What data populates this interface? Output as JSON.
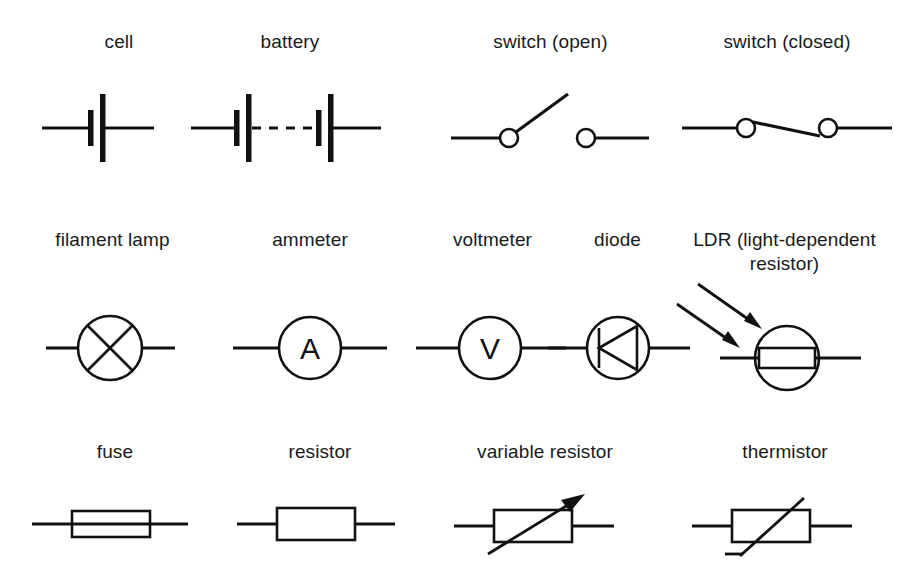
{
  "page": {
    "background_color": "#ffffff",
    "line_color": "#111111",
    "text_color": "#1a1a1a",
    "width": 914,
    "height": 562,
    "row_count": 3,
    "symbol_count": 13
  },
  "rows": [
    {
      "index": 1,
      "symbols": [
        {
          "label": "cell",
          "icon": "cell-symbol"
        },
        {
          "label": "battery",
          "icon": "battery-symbol"
        },
        {
          "label": "switch (open)",
          "icon": "switch-open-symbol"
        },
        {
          "label": "switch (closed)",
          "icon": "switch-closed-symbol"
        }
      ]
    },
    {
      "index": 2,
      "symbols": [
        {
          "label": "filament lamp",
          "icon": "filament-lamp-symbol"
        },
        {
          "label": "ammeter",
          "icon": "ammeter-symbol",
          "glyph": "A"
        },
        {
          "label": "voltmeter",
          "icon": "voltmeter-symbol",
          "glyph": "V"
        },
        {
          "label": "diode",
          "icon": "diode-symbol"
        },
        {
          "label": "LDR (light-dependent\nresistor)",
          "icon": "ldr-symbol"
        }
      ]
    },
    {
      "index": 3,
      "symbols": [
        {
          "label": "fuse",
          "icon": "fuse-symbol"
        },
        {
          "label": "resistor",
          "icon": "resistor-symbol"
        },
        {
          "label": "variable resistor",
          "icon": "variable-resistor-symbol"
        },
        {
          "label": "thermistor",
          "icon": "thermistor-symbol"
        }
      ]
    }
  ]
}
